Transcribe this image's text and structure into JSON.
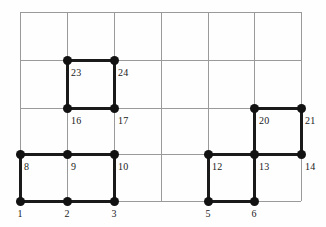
{
  "figure": {
    "kind": "lattice-path-diagram",
    "width": 326,
    "height": 227,
    "background_color": "#fefefe",
    "grid_line_color": "#9a9a9a",
    "path_color": "#1a1a1a",
    "node_color": "#121212",
    "grid": {
      "columns": 6,
      "rows": 4,
      "x_positions": [
        20,
        67,
        114,
        161,
        208,
        254,
        301
      ],
      "y_positions": [
        12,
        60,
        108,
        154,
        201
      ]
    }
  },
  "cell_labels": [
    {
      "text": "23",
      "x": 71,
      "y": 67
    },
    {
      "text": "24",
      "x": 118,
      "y": 67
    },
    {
      "text": "16",
      "x": 71,
      "y": 115
    },
    {
      "text": "17",
      "x": 118,
      "y": 115
    },
    {
      "text": "20",
      "x": 259,
      "y": 115
    },
    {
      "text": "21",
      "x": 305,
      "y": 115
    },
    {
      "text": "8",
      "x": 24,
      "y": 161
    },
    {
      "text": "9",
      "x": 71,
      "y": 161
    },
    {
      "text": "10",
      "x": 118,
      "y": 161
    },
    {
      "text": "12",
      "x": 212,
      "y": 161
    },
    {
      "text": "13",
      "x": 259,
      "y": 161
    },
    {
      "text": "14",
      "x": 305,
      "y": 161
    }
  ],
  "axis_labels": [
    {
      "text": "1",
      "x": 20,
      "y": 208
    },
    {
      "text": "2",
      "x": 67,
      "y": 208
    },
    {
      "text": "3",
      "x": 114,
      "y": 208
    },
    {
      "text": "5",
      "x": 208,
      "y": 208
    },
    {
      "text": "6",
      "x": 254,
      "y": 208
    }
  ],
  "grid_lines_vertical": [
    {
      "x": 20,
      "y1": 12,
      "y2": 201
    },
    {
      "x": 67,
      "y1": 12,
      "y2": 201
    },
    {
      "x": 114,
      "y1": 12,
      "y2": 201
    },
    {
      "x": 161,
      "y1": 12,
      "y2": 201
    },
    {
      "x": 208,
      "y1": 12,
      "y2": 201
    },
    {
      "x": 254,
      "y1": 12,
      "y2": 201
    },
    {
      "x": 301,
      "y1": 12,
      "y2": 201
    }
  ],
  "grid_lines_horizontal": [
    {
      "y": 12,
      "x1": 20,
      "x2": 301
    },
    {
      "y": 60,
      "x1": 20,
      "x2": 301
    },
    {
      "y": 108,
      "x1": 20,
      "x2": 301
    },
    {
      "y": 154,
      "x1": 20,
      "x2": 301
    },
    {
      "y": 201,
      "x1": 20,
      "x2": 301
    }
  ],
  "path_edges_horizontal": [
    {
      "y": 60,
      "x1": 67,
      "x2": 114
    },
    {
      "y": 108,
      "x1": 67,
      "x2": 114
    },
    {
      "y": 108,
      "x1": 254,
      "x2": 301
    },
    {
      "y": 154,
      "x1": 20,
      "x2": 114
    },
    {
      "y": 154,
      "x1": 208,
      "x2": 301
    },
    {
      "y": 201,
      "x1": 20,
      "x2": 114
    },
    {
      "y": 201,
      "x1": 208,
      "x2": 254
    }
  ],
  "path_edges_vertical": [
    {
      "x": 67,
      "y1": 60,
      "y2": 108
    },
    {
      "x": 114,
      "y1": 60,
      "y2": 108
    },
    {
      "x": 254,
      "y1": 108,
      "y2": 154
    },
    {
      "x": 301,
      "y1": 108,
      "y2": 154
    },
    {
      "x": 20,
      "y1": 154,
      "y2": 201
    },
    {
      "x": 114,
      "y1": 154,
      "y2": 201
    },
    {
      "x": 208,
      "y1": 154,
      "y2": 201
    },
    {
      "x": 254,
      "y1": 154,
      "y2": 201
    }
  ],
  "nodes": [
    {
      "x": 67,
      "y": 60
    },
    {
      "x": 114,
      "y": 60
    },
    {
      "x": 67,
      "y": 108
    },
    {
      "x": 114,
      "y": 108
    },
    {
      "x": 254,
      "y": 108
    },
    {
      "x": 301,
      "y": 108
    },
    {
      "x": 20,
      "y": 154
    },
    {
      "x": 67,
      "y": 154
    },
    {
      "x": 114,
      "y": 154
    },
    {
      "x": 208,
      "y": 154
    },
    {
      "x": 254,
      "y": 154
    },
    {
      "x": 301,
      "y": 154
    },
    {
      "x": 20,
      "y": 201
    },
    {
      "x": 67,
      "y": 201
    },
    {
      "x": 114,
      "y": 201
    },
    {
      "x": 208,
      "y": 201
    },
    {
      "x": 254,
      "y": 201
    }
  ]
}
